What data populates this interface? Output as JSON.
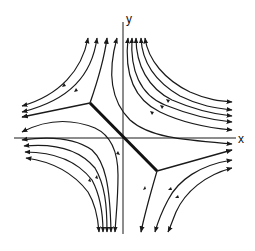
{
  "figure": {
    "type": "phase-portrait",
    "axes": {
      "x_label": "x",
      "y_label": "y"
    },
    "colors": {
      "ink": "#1a1a1a",
      "background": "#ffffff"
    },
    "elements": {
      "thick_segment": {
        "from": [
          90,
          103
        ],
        "to": [
          157,
          171
        ]
      },
      "separatrix_upper_left": {
        "branches": [
          "to-left",
          "to-top"
        ]
      },
      "separatrix_lower_right": {
        "branches": [
          "to-right",
          "to-bottom"
        ]
      }
    },
    "streamline_directions": {
      "top": "up",
      "bottom": "down",
      "left": "left",
      "right": "right"
    }
  }
}
